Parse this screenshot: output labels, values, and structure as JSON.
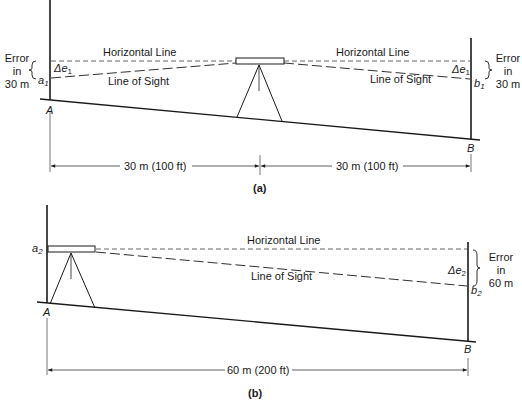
{
  "figure": {
    "panel_a": {
      "caption": "(a)",
      "horizontal_line_left": "Horizontal Line",
      "horizontal_line_right": "Horizontal Line",
      "line_of_sight_left": "Line of Sight",
      "line_of_sight_right": "Line of Sight",
      "error_left": [
        "Error",
        "in",
        "30 m"
      ],
      "error_right": [
        "Error",
        "in",
        "30 m"
      ],
      "delta_left": {
        "base": "Δe",
        "sub": "1"
      },
      "delta_right": {
        "base": "Δe",
        "sub": "1"
      },
      "point_a": {
        "base": "a",
        "sub": "1"
      },
      "point_b": {
        "base": "b",
        "sub": "1"
      },
      "station_a": "A",
      "station_b": "B",
      "dimension_left": "30 m (100 ft)",
      "dimension_right": "30 m (100 ft)"
    },
    "panel_b": {
      "caption": "(b)",
      "horizontal_line": "Horizontal Line",
      "line_of_sight": "Line of Sight",
      "error_right": [
        "Error",
        "in",
        "60 m"
      ],
      "delta": {
        "base": "Δe",
        "sub": "2"
      },
      "point_a": {
        "base": "a",
        "sub": "2"
      },
      "point_b": {
        "base": "b",
        "sub": "2"
      },
      "station_a": "A",
      "station_b": "B",
      "dimension": "60 m (200 ft)"
    }
  }
}
